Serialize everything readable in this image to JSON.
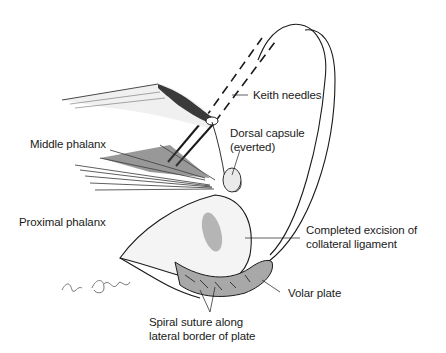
{
  "diagram": {
    "type": "anatomical-illustration",
    "labels": {
      "keith_needles": "Keith needles",
      "dorsal_capsule_line1": "Dorsal capsule",
      "dorsal_capsule_line2": "(everted)",
      "middle_phalanx": "Middle phalanx",
      "proximal_phalanx": "Proximal phalanx",
      "collateral_line1": "Completed excision of",
      "collateral_line2": "collateral ligament",
      "volar_plate": "Volar plate",
      "suture_line1": "Spiral suture along",
      "suture_line2": "lateral border of plate"
    },
    "signature": "artist signature",
    "colors": {
      "ink": "#1a1a1a",
      "shading": "#b5b5b5",
      "plate_fill": "#a8a8a8",
      "background": "#ffffff"
    }
  }
}
